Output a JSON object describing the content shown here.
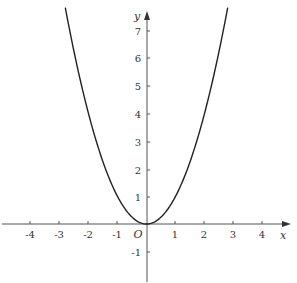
{
  "chart_data": {
    "type": "line",
    "title": "",
    "function": "y = x^2",
    "xlabel": "x",
    "ylabel": "y",
    "origin_label": "O",
    "xlim": [
      -4.8,
      4.9
    ],
    "ylim": [
      -2,
      7.8
    ],
    "x_ticks": [
      -4,
      -3,
      -2,
      -1,
      1,
      2,
      3,
      4
    ],
    "y_ticks": [
      -1,
      1,
      2,
      3,
      4,
      5,
      6,
      7
    ],
    "grid": false,
    "legend": null,
    "series": [
      {
        "name": "y = x^2",
        "x": [
          -2.8,
          -2.5,
          -2,
          -1.5,
          -1,
          -0.5,
          0,
          0.5,
          1,
          1.5,
          2,
          2.5,
          2.8
        ],
        "y": [
          7.84,
          6.25,
          4,
          2.25,
          1,
          0.25,
          0,
          0.25,
          1,
          2.25,
          4,
          6.25,
          7.84
        ]
      }
    ],
    "colors": {
      "curve": "#222222",
      "axes": "#555555",
      "text": "#333333"
    }
  },
  "labels": {
    "x_axis": "x",
    "y_axis": "y",
    "origin": "O",
    "x_ticks": [
      "-4",
      "-3",
      "-2",
      "-1",
      "1",
      "2",
      "3",
      "4"
    ],
    "y_ticks": [
      "7",
      "6",
      "5",
      "4",
      "3",
      "2",
      "1",
      "-1"
    ]
  }
}
